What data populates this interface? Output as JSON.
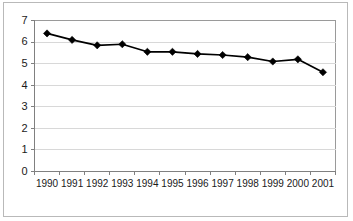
{
  "chart_data": {
    "type": "line",
    "title": "",
    "subtitle": "",
    "xlabel": "",
    "ylabel": "",
    "categories": [
      "1990",
      "1991",
      "1992",
      "1993",
      "1994",
      "1995",
      "1996",
      "1997",
      "1998",
      "1999",
      "2000",
      "2001"
    ],
    "x": [
      1990,
      1991,
      1992,
      1993,
      1994,
      1995,
      1996,
      1997,
      1998,
      1999,
      2000,
      2001
    ],
    "values": [
      6.4,
      6.1,
      5.85,
      5.9,
      5.55,
      5.55,
      5.45,
      5.4,
      5.3,
      5.1,
      5.2,
      4.6
    ],
    "series": [
      {
        "name": "",
        "values": [
          6.4,
          6.1,
          5.85,
          5.9,
          5.55,
          5.55,
          5.45,
          5.4,
          5.3,
          5.1,
          5.2,
          4.6
        ],
        "marker": "diamond",
        "color": "#000000"
      }
    ],
    "ylim": [
      0,
      7
    ],
    "yticks": [
      0,
      1,
      2,
      3,
      4,
      5,
      6,
      7
    ],
    "ytick_labels": [
      "0",
      "1",
      "2",
      "3",
      "4",
      "5",
      "6",
      "7"
    ],
    "grid": true,
    "grid_axis": "y",
    "legend": false,
    "legend_position": "none",
    "plot_background": "#ffffff",
    "line_color": "#000000",
    "gridline_color": "#d8d8d8",
    "axis_color": "#808080",
    "border_color": "#b9b9b9",
    "annotations": []
  }
}
